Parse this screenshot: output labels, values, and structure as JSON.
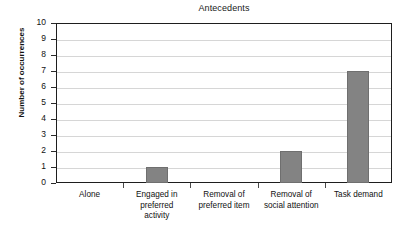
{
  "chart_data": {
    "type": "bar",
    "title": "Antecedents",
    "xlabel": "",
    "ylabel": "Number of occurrences",
    "categories": [
      "Alone",
      "Engaged in preferred activity",
      "Removal of preferred item",
      "Removal of social attention",
      "Task demand"
    ],
    "category_lines": [
      [
        "Alone"
      ],
      [
        "Engaged in",
        "preferred",
        "activity"
      ],
      [
        "Removal of",
        "preferred item"
      ],
      [
        "Removal of",
        "social attention"
      ],
      [
        "Task demand"
      ]
    ],
    "values": [
      0,
      1,
      0,
      2,
      7
    ],
    "ylim": [
      0,
      10
    ],
    "ytick_labels": [
      "10",
      "9",
      "8",
      "7",
      "6",
      "5",
      "4",
      "3",
      "2",
      "1",
      "0"
    ],
    "ytick_values": [
      10,
      9,
      8,
      7,
      6,
      5,
      4,
      3,
      2,
      1,
      0
    ],
    "grid": true,
    "legend": false,
    "bar_color": "#838383",
    "gridline_color": "#d6d6d6",
    "axis_color": "#1e1e1e",
    "background_color": "#ffffff"
  }
}
